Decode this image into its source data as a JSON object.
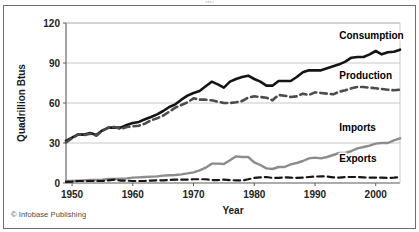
{
  "figure": {
    "credit": "© Infobase Publishing",
    "title_fragment": "gy",
    "frame_color": "#6d6d6d",
    "background": "#ffffff"
  },
  "chart_data": {
    "type": "line",
    "title": "",
    "xlabel": "Year",
    "ylabel": "Quadrillion Btus",
    "xlim": [
      1949,
      2004
    ],
    "ylim": [
      0,
      120
    ],
    "yticks": [
      0,
      30,
      60,
      90,
      120
    ],
    "xticks": [
      1950,
      1960,
      1970,
      1980,
      1990,
      2000
    ],
    "grid": "horizontal",
    "legend_position": "inline-right-labels",
    "x": [
      1949,
      1950,
      1951,
      1952,
      1953,
      1954,
      1955,
      1956,
      1957,
      1958,
      1959,
      1960,
      1961,
      1962,
      1963,
      1964,
      1965,
      1966,
      1967,
      1968,
      1969,
      1970,
      1971,
      1972,
      1973,
      1974,
      1975,
      1976,
      1977,
      1978,
      1979,
      1980,
      1981,
      1982,
      1983,
      1984,
      1985,
      1986,
      1987,
      1988,
      1989,
      1990,
      1991,
      1992,
      1993,
      1994,
      1995,
      1996,
      1997,
      1998,
      1999,
      2000,
      2001,
      2002,
      2003,
      2004
    ],
    "series": [
      {
        "name": "Consumption",
        "label": "Consumption",
        "color": "#141414",
        "style": "solid",
        "width": 2.6,
        "label_x": 1994,
        "label_y": 108,
        "values": [
          31.5,
          34.0,
          36.5,
          36.3,
          37.5,
          36.0,
          39.5,
          41.5,
          41.5,
          41.5,
          43.5,
          45.0,
          45.8,
          47.8,
          49.5,
          51.5,
          54.0,
          57.0,
          59.0,
          62.5,
          65.5,
          67.5,
          69.0,
          72.5,
          76.0,
          74.0,
          71.5,
          76.0,
          78.0,
          79.5,
          80.5,
          78.0,
          76.0,
          73.0,
          73.0,
          76.5,
          76.5,
          76.5,
          79.5,
          83.0,
          84.5,
          84.5,
          84.5,
          86.0,
          87.5,
          89.0,
          91.0,
          94.0,
          94.5,
          94.5,
          96.5,
          99.0,
          96.5,
          98.0,
          98.5,
          100.0
        ]
      },
      {
        "name": "Production",
        "label": "Production",
        "color": "#4c4c4c",
        "style": "dashed",
        "width": 2.6,
        "label_x": 1994,
        "label_y": 78,
        "values": [
          30.5,
          33.5,
          36.5,
          36.0,
          37.0,
          35.5,
          39.0,
          41.5,
          42.0,
          40.5,
          42.0,
          42.5,
          43.0,
          44.5,
          47.0,
          48.5,
          50.5,
          53.5,
          56.5,
          58.5,
          60.5,
          63.5,
          62.5,
          62.5,
          62.0,
          61.0,
          60.0,
          60.0,
          60.5,
          61.5,
          64.0,
          65.0,
          64.5,
          64.0,
          62.0,
          66.0,
          65.5,
          64.5,
          65.0,
          67.0,
          66.0,
          68.0,
          67.5,
          67.0,
          66.5,
          68.5,
          69.5,
          71.0,
          72.0,
          72.0,
          71.5,
          71.0,
          70.5,
          70.0,
          69.5,
          70.0
        ]
      },
      {
        "name": "Imports",
        "label": "Imports",
        "color": "#8c8c8c",
        "style": "solid",
        "width": 2.4,
        "label_x": 1994,
        "label_y": 39,
        "values": [
          1.5,
          1.5,
          1.8,
          2.0,
          2.2,
          2.2,
          2.5,
          3.0,
          3.0,
          3.2,
          3.5,
          4.0,
          4.2,
          4.5,
          4.8,
          5.0,
          5.5,
          5.8,
          6.0,
          6.5,
          7.2,
          8.0,
          9.5,
          11.5,
          14.5,
          14.5,
          14.2,
          17.0,
          20.0,
          19.5,
          19.5,
          15.5,
          13.5,
          11.0,
          10.5,
          12.0,
          12.0,
          14.0,
          15.0,
          16.5,
          18.5,
          19.0,
          18.5,
          19.5,
          21.0,
          22.5,
          22.5,
          24.0,
          26.0,
          27.0,
          28.0,
          29.5,
          30.0,
          30.0,
          32.0,
          33.5
        ]
      },
      {
        "name": "Exports",
        "label": "Exports",
        "color": "#161616",
        "style": "dashed",
        "width": 2.2,
        "label_x": 1994,
        "label_y": 16,
        "values": [
          0.8,
          1.0,
          1.5,
          1.5,
          1.5,
          1.5,
          1.5,
          2.0,
          2.5,
          1.8,
          1.8,
          1.5,
          1.5,
          1.5,
          1.8,
          2.0,
          2.0,
          2.2,
          2.5,
          2.5,
          2.5,
          2.8,
          2.8,
          2.8,
          2.2,
          2.2,
          2.5,
          2.2,
          2.0,
          1.9,
          2.8,
          3.8,
          4.2,
          4.5,
          3.8,
          3.8,
          4.2,
          4.0,
          3.8,
          4.0,
          4.5,
          4.8,
          5.0,
          4.8,
          4.2,
          4.0,
          4.5,
          4.5,
          4.5,
          4.2,
          4.0,
          4.0,
          4.0,
          3.8,
          4.0,
          4.3
        ]
      }
    ]
  }
}
